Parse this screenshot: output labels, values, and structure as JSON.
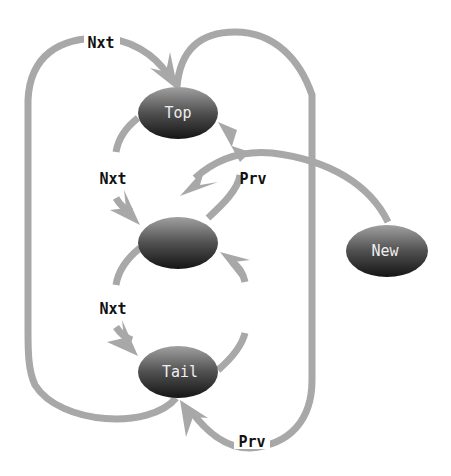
{
  "diagram": {
    "type": "doubly-linked-list-insertion",
    "nodes": [
      {
        "id": "top",
        "label": "Top",
        "cx": 178,
        "cy": 113
      },
      {
        "id": "middle",
        "label": "",
        "cx": 178,
        "cy": 243
      },
      {
        "id": "tail",
        "label": "Tail",
        "cx": 178,
        "cy": 372
      },
      {
        "id": "new",
        "label": "New",
        "cx": 387,
        "cy": 251
      }
    ],
    "edge_labels": {
      "nxt_outer": "Nxt",
      "nxt_top_mid": "Nxt",
      "prv_mid_top": "Prv",
      "nxt_mid_tail": "Nxt",
      "prv_tail_mid": "Prv",
      "prv_outer": "Prv"
    },
    "colors": {
      "edge": "#a8a8a8",
      "node_dark": "#1a1a1a",
      "node_light": "#9a9a9a",
      "label": "#111111"
    }
  }
}
